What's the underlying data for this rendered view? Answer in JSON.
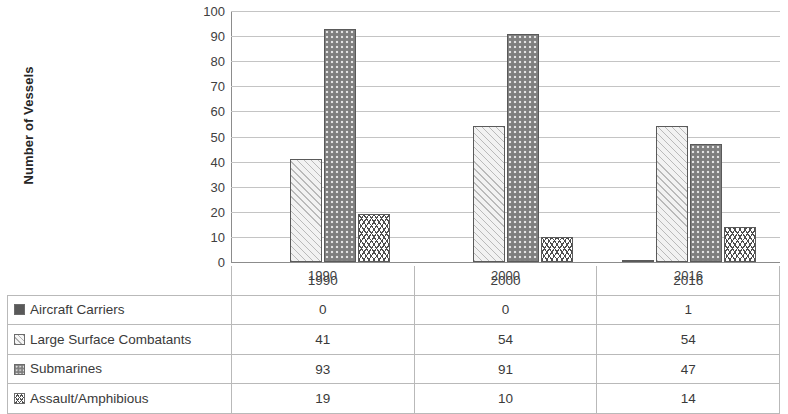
{
  "chart_data": {
    "type": "bar",
    "title": "",
    "xlabel": "",
    "ylabel": "Number of Vessels",
    "categories": [
      "1990",
      "2000",
      "2016"
    ],
    "ylim": [
      0,
      100
    ],
    "ytick_step": 10,
    "yticks": [
      "100",
      "90",
      "80",
      "70",
      "60",
      "50",
      "40",
      "30",
      "20",
      "10",
      "0"
    ],
    "grid": true,
    "legend_position": "table-below",
    "series": [
      {
        "name": "Aircraft Carriers",
        "values": [
          0,
          0,
          1
        ],
        "pattern": "solid-dark-gray",
        "color": "#595959"
      },
      {
        "name": "Large Surface Combatants",
        "values": [
          41,
          54,
          54
        ],
        "pattern": "light-diagonal-hatch",
        "color": "#f2f2f2"
      },
      {
        "name": "Submarines",
        "values": [
          93,
          91,
          47
        ],
        "pattern": "gray-dotted",
        "color": "#7f7f7f"
      },
      {
        "name": "Assault/Amphibious",
        "values": [
          19,
          10,
          14
        ],
        "pattern": "white-zigzag",
        "color": "#ffffff"
      }
    ]
  },
  "axis": {
    "y_title": "Number of Vessels",
    "ticks": [
      "100",
      "90",
      "80",
      "70",
      "60",
      "50",
      "40",
      "30",
      "20",
      "10",
      "0"
    ],
    "group_labels": [
      "1990",
      "2000",
      "2016"
    ]
  },
  "table": {
    "header": [
      "",
      "1990",
      "2000",
      "2016"
    ],
    "rows": [
      {
        "label": "Aircraft Carriers",
        "swatch": "sw-carriers",
        "values": [
          "0",
          "0",
          "1"
        ]
      },
      {
        "label": "Large Surface Combatants",
        "swatch": "sw-large",
        "values": [
          "41",
          "54",
          "54"
        ]
      },
      {
        "label": "Submarines",
        "swatch": "sw-subs",
        "values": [
          "93",
          "91",
          "47"
        ]
      },
      {
        "label": "Assault/Amphibious",
        "swatch": "sw-assault",
        "values": [
          "19",
          "10",
          "14"
        ]
      }
    ]
  }
}
